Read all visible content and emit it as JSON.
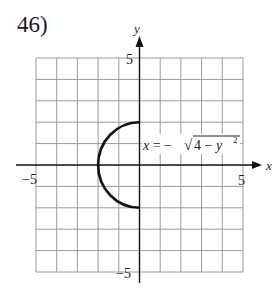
{
  "problem": {
    "number": "46)"
  },
  "graph": {
    "x_axis_label": "x",
    "y_axis_label": "y",
    "tick_labels": {
      "x_min": "−5",
      "x_max": "5",
      "y_max": "5",
      "y_min": "−5"
    },
    "equation": "x = −√(4 − y²)",
    "equation_parts": {
      "lhs": "x = −",
      "radical": "√",
      "radicand": "4 − y",
      "exponent": "2"
    },
    "grid": {
      "xmin": -5,
      "xmax": 5,
      "ymin": -5,
      "ymax": 5,
      "step": 1
    },
    "curve": {
      "type": "left semicircle",
      "center": [
        0,
        0
      ],
      "radius": 2
    },
    "colors": {
      "grid": "#9a9a9a",
      "axis": "#111111",
      "curve": "#111111"
    }
  }
}
